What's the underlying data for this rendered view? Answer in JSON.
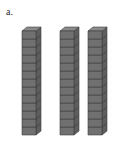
{
  "problem": {
    "label": "a.",
    "label_name": "problem-letter-a"
  },
  "figure": {
    "type": "isometric-unit-cube-towers",
    "background_color": "#ffffff",
    "tower_count": 3,
    "cubes_per_tower": 13,
    "total_cubes": 39,
    "towers": [
      {
        "id": "tower-1",
        "cubes": 13,
        "x": 21,
        "y": 26
      },
      {
        "id": "tower-2",
        "cubes": 13,
        "x": 59,
        "y": 26
      },
      {
        "id": "tower-3",
        "cubes": 13,
        "x": 87,
        "y": 26
      }
    ],
    "cube": {
      "width": 14,
      "height": 8,
      "depth_x": 5,
      "depth_y": 4,
      "top_face_color": "#8a8a8a",
      "front_face_color": "#707070",
      "side_face_color": "#5e5e5e",
      "edge_color": "#3d3d3d",
      "edge_width": 0.6
    }
  }
}
